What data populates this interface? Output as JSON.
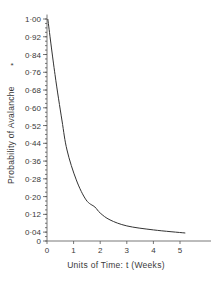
{
  "chart_data": {
    "type": "line",
    "title": "",
    "xlabel": "Units of Time: t (Weeks)",
    "ylabel": "Probability of Avalanche",
    "xlim": [
      0,
      6.2
    ],
    "ylim": [
      0,
      1.0
    ],
    "grid": false,
    "legend": null,
    "x_ticks": [
      "0",
      "1",
      "2",
      "3",
      "4",
      "5"
    ],
    "y_ticks": [
      "0",
      "0·04",
      "0·12",
      "0·20",
      "0·28",
      "0·36",
      "0·44",
      "0·52",
      "0·60",
      "0·68",
      "0·76",
      "0·84",
      "0·92",
      "1·00"
    ],
    "series": [
      {
        "name": "Probability of Avalanche",
        "color": "#333333",
        "x": [
          0.03,
          0.3,
          0.56,
          0.75,
          1.1,
          1.47,
          1.8,
          2.0,
          2.37,
          3.0,
          4.0,
          5.2
        ],
        "y": [
          1.0,
          0.75,
          0.545,
          0.41,
          0.275,
          0.185,
          0.153,
          0.126,
          0.095,
          0.068,
          0.05,
          0.036
        ]
      }
    ]
  },
  "labels": {
    "xlabel": "Units of Time: t (Weeks)",
    "ylabel": "Probability of Avalanche",
    "asterisk": "*"
  },
  "colors": {
    "line": "#333333",
    "axis": "#555555",
    "text": "#3a3a3a"
  }
}
